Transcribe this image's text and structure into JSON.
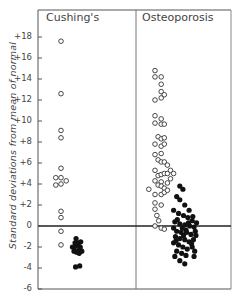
{
  "chart_data": {
    "type": "scatter",
    "title": "",
    "xlabel": "",
    "ylabel": "Standard deviations from mean of normal",
    "ylim": [
      -6,
      20
    ],
    "yticks": [
      -6,
      -4,
      -2,
      0,
      2,
      4,
      6,
      8,
      10,
      12,
      14,
      16,
      18
    ],
    "ytick_labels": [
      "-6",
      "-4",
      "-2",
      "0",
      "+2",
      "+4",
      "+6",
      "+8",
      "+10",
      "+12",
      "+14",
      "+16",
      "+18"
    ],
    "grid": false,
    "reference_line": 0,
    "panels": [
      {
        "name": "Cushing's",
        "series": [
          {
            "name": "open circles",
            "marker": "open",
            "points": [
              [
                0,
                17.6
              ],
              [
                0,
                12.6
              ],
              [
                0,
                9.1
              ],
              [
                0,
                8.4
              ],
              [
                0,
                5.5
              ],
              [
                0,
                4.6
              ],
              [
                0,
                4.0
              ],
              [
                -1,
                4.6
              ],
              [
                -1,
                3.9
              ],
              [
                1,
                4.3
              ],
              [
                0,
                1.4
              ],
              [
                0,
                0.8
              ],
              [
                0,
                -0.5
              ],
              [
                0,
                -1.8
              ]
            ]
          },
          {
            "name": "filled circles",
            "marker": "filled",
            "points": [
              [
                2.2,
                -2.0
              ],
              [
                2.5,
                -2.4
              ],
              [
                2.7,
                -1.6
              ],
              [
                2.9,
                -1.2
              ],
              [
                3.1,
                -1.8
              ],
              [
                3.3,
                -2.4
              ],
              [
                3.4,
                -1.6
              ],
              [
                3.5,
                -2.6
              ],
              [
                3.6,
                -2.1
              ],
              [
                3.8,
                -1.5
              ],
              [
                4.0,
                -2.4
              ],
              [
                2.8,
                -3.9
              ],
              [
                3.6,
                -3.8
              ],
              [
                2.6,
                -2.0
              ],
              [
                3.0,
                -2.5
              ],
              [
                3.7,
                -2.0
              ]
            ]
          }
        ]
      },
      {
        "name": "Osteoporosis",
        "series": [
          {
            "name": "open circles",
            "marker": "open",
            "points": [
              [
                0,
                14.8
              ],
              [
                0,
                14.2
              ],
              [
                1,
                14.2
              ],
              [
                1,
                13.5
              ],
              [
                1,
                12.8
              ],
              [
                0,
                12.0
              ],
              [
                1,
                12.2
              ],
              [
                1.5,
                12.5
              ],
              [
                0,
                10.5
              ],
              [
                1,
                10.2
              ],
              [
                0,
                9.8
              ],
              [
                1,
                9.7
              ],
              [
                1.5,
                9.7
              ],
              [
                0.5,
                8.5
              ],
              [
                1,
                8.3
              ],
              [
                1.5,
                8.4
              ],
              [
                0,
                7.8
              ],
              [
                1,
                7.6
              ],
              [
                1.5,
                7.8
              ],
              [
                0,
                6.8
              ],
              [
                1,
                6.9
              ],
              [
                0.5,
                6.3
              ],
              [
                1,
                6.1
              ],
              [
                1.5,
                6.1
              ],
              [
                2,
                5.8
              ],
              [
                0,
                5.3
              ],
              [
                0.5,
                4.8
              ],
              [
                1,
                4.9
              ],
              [
                1.5,
                5.0
              ],
              [
                2,
                5.0
              ],
              [
                2.5,
                5.3
              ],
              [
                3,
                5.0
              ],
              [
                1,
                4.2
              ],
              [
                0,
                4.3
              ],
              [
                0.5,
                3.9
              ],
              [
                1,
                3.8
              ],
              [
                1.5,
                3.6
              ],
              [
                2,
                4.1
              ],
              [
                2.5,
                4.5
              ],
              [
                -1,
                3.5
              ],
              [
                0,
                3.0
              ],
              [
                1,
                3.0
              ],
              [
                1.5,
                3.2
              ],
              [
                2,
                3.4
              ],
              [
                0,
                2.2
              ],
              [
                1,
                2.0
              ],
              [
                0,
                1.6
              ],
              [
                0.3,
                1.0
              ],
              [
                0.6,
                0.5
              ],
              [
                0,
                0
              ],
              [
                1,
                -0.2
              ],
              [
                1.5,
                -0.3
              ]
            ]
          },
          {
            "name": "filled circles",
            "marker": "filled",
            "points": [
              [
                4.0,
                3.8
              ],
              [
                4.5,
                3.5
              ],
              [
                3.5,
                2.8
              ],
              [
                4.0,
                2.5
              ],
              [
                4.8,
                2.0
              ],
              [
                5.5,
                1.5
              ],
              [
                3.0,
                1.5
              ],
              [
                3.8,
                1.2
              ],
              [
                4.6,
                1.0
              ],
              [
                5.3,
                0.8
              ],
              [
                6.0,
                0.5
              ],
              [
                3.2,
                0.4
              ],
              [
                4.0,
                0.2
              ],
              [
                4.8,
                0.1
              ],
              [
                5.6,
                0
              ],
              [
                6.3,
                -0.1
              ],
              [
                3.0,
                -0.2
              ],
              [
                3.5,
                -0.5
              ],
              [
                4.2,
                -0.6
              ],
              [
                5.0,
                -0.4
              ],
              [
                5.8,
                -0.8
              ],
              [
                6.5,
                -0.5
              ],
              [
                3.3,
                -1.0
              ],
              [
                4.0,
                -1.2
              ],
              [
                4.8,
                -1.3
              ],
              [
                5.5,
                -1.5
              ],
              [
                6.2,
                -1.3
              ],
              [
                3.0,
                -1.6
              ],
              [
                3.8,
                -1.8
              ],
              [
                4.5,
                -2.0
              ],
              [
                5.2,
                -2.2
              ],
              [
                6.0,
                -2.0
              ],
              [
                3.5,
                -2.4
              ],
              [
                4.3,
                -2.6
              ],
              [
                5.0,
                -2.8
              ],
              [
                3.2,
                -2.9
              ],
              [
                4.0,
                -3.3
              ],
              [
                4.8,
                -3.6
              ],
              [
                6.4,
                -2.4
              ],
              [
                6.6,
                -0.9
              ],
              [
                6.1,
                0.9
              ],
              [
                5.4,
                0.3
              ],
              [
                4.4,
                -0.2
              ],
              [
                3.6,
                0.6
              ],
              [
                4.6,
                -0.9
              ],
              [
                5.9,
                -1.7
              ],
              [
                6.7,
                0.3
              ],
              [
                3.4,
                -1.4
              ],
              [
                5.1,
                -0.6
              ],
              [
                6.3,
                -2.9
              ]
            ]
          }
        ]
      }
    ]
  },
  "panels": {
    "left_title": "Cushing's",
    "right_title": "Osteoporosis"
  },
  "axis": {
    "ylabel": "Standard deviations from mean of normal",
    "ticks": [
      "+18",
      "+16",
      "+14",
      "+12",
      "+10",
      "+8",
      "+6",
      "+4",
      "+2",
      "0",
      "-2",
      "-4",
      "-6"
    ]
  }
}
